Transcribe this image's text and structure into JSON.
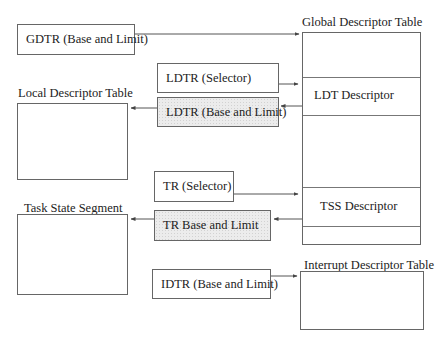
{
  "registers": {
    "gdtr": "GDTR (Base and Limit)",
    "ldtr_selector": "LDTR (Selector)",
    "ldtr_base": "LDTR (Base and Limit)",
    "tr_selector": "TR (Selector)",
    "tr_base": "TR Base and Limit",
    "idtr": "IDTR (Base and Limit)"
  },
  "tables": {
    "gdt": {
      "title": "Global Descriptor Table",
      "entries": [
        "LDT Descriptor",
        "TSS Descriptor"
      ]
    },
    "ldt": {
      "title": "Local Descriptor Table"
    },
    "tss": {
      "title": "Task State Segment"
    },
    "idt": {
      "title": "Interrupt Descriptor Table"
    }
  },
  "colors": {
    "line": "#555555",
    "shaded_fill": "#ececec"
  }
}
